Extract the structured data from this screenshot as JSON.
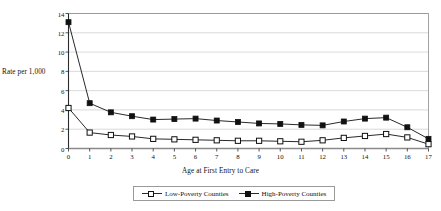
{
  "chart": {
    "title": "",
    "y_axis_label": "Rate per 1,000",
    "x_axis_label": "Age at First Entry to Care",
    "legend": {
      "low": "Low-Poverty Counties",
      "high": "High-Poverty Counties"
    }
  },
  "chart_data": {
    "type": "line",
    "title": "",
    "xlabel": "Age at First Entry to Care",
    "ylabel": "Rate per 1,000",
    "xlim": [
      0,
      17
    ],
    "ylim": [
      0,
      14
    ],
    "yticks": [
      0,
      2,
      4,
      6,
      8,
      10,
      12,
      14
    ],
    "xticks": [
      0,
      1,
      2,
      3,
      4,
      5,
      6,
      7,
      8,
      9,
      10,
      11,
      12,
      13,
      14,
      15,
      16,
      17
    ],
    "grid": "horizontal",
    "legend_position": "bottom",
    "x": [
      0,
      1,
      2,
      3,
      4,
      5,
      6,
      7,
      8,
      9,
      10,
      11,
      12,
      13,
      14,
      15,
      16,
      17
    ],
    "series": [
      {
        "name": "Low-Poverty Counties",
        "marker": "open-square",
        "color": "#111111",
        "values": [
          4.2,
          1.65,
          1.4,
          1.25,
          1.0,
          0.95,
          0.9,
          0.85,
          0.8,
          0.8,
          0.75,
          0.7,
          0.85,
          1.1,
          1.3,
          1.5,
          1.15,
          0.45
        ]
      },
      {
        "name": "High-Poverty Counties",
        "marker": "filled-square",
        "color": "#111111",
        "values": [
          13.1,
          4.7,
          3.75,
          3.35,
          3.0,
          3.05,
          3.1,
          2.9,
          2.75,
          2.6,
          2.55,
          2.45,
          2.4,
          2.8,
          3.1,
          3.2,
          2.2,
          1.0
        ]
      }
    ]
  }
}
